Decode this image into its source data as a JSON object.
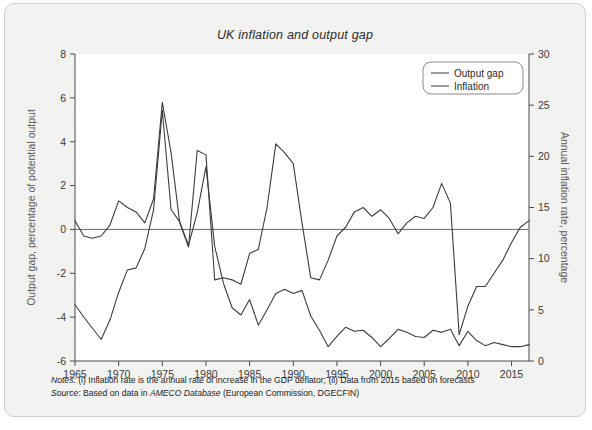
{
  "figure": {
    "title": "UK inflation and output gap",
    "background_color": "#f2f2f0",
    "plot_background_color": "#ffffff",
    "border_color": "#cfcfcb",
    "line_color": "#3c3c3c"
  },
  "notes": {
    "notes_label": "Notes:",
    "notes_text": " (i) Inflation rate is the annual rate of increase in the GDP deflator; (ii) Data from 2015 based on forecasts",
    "source_label": "Source:",
    "source_text_pre": " Based on data in ",
    "source_italic": "AMECO Database",
    "source_text_post": " (European Commission, DGECFIN)"
  },
  "chart_data": {
    "type": "line",
    "title": "UK inflation and output gap",
    "xlabel": "",
    "ylabel": "Output gap, percentage of potential output",
    "y2label": "Annual inflation rate, percentage",
    "xlim": [
      1965,
      2017
    ],
    "ylim": [
      -6,
      8
    ],
    "y2lim": [
      0,
      30
    ],
    "xticks": [
      1965,
      1970,
      1975,
      1980,
      1985,
      1990,
      1995,
      2000,
      2005,
      2010,
      2015
    ],
    "yticks": [
      -6,
      -4,
      -2,
      0,
      2,
      4,
      6,
      8
    ],
    "y2ticks": [
      0,
      5,
      10,
      15,
      20,
      25,
      30
    ],
    "grid": false,
    "legend_position": "top-right",
    "zero_line": true,
    "x": [
      1965,
      1966,
      1967,
      1968,
      1969,
      1970,
      1971,
      1972,
      1973,
      1974,
      1975,
      1976,
      1977,
      1978,
      1979,
      1980,
      1981,
      1982,
      1983,
      1984,
      1985,
      1986,
      1987,
      1988,
      1989,
      1990,
      1991,
      1992,
      1993,
      1994,
      1995,
      1996,
      1997,
      1998,
      1999,
      2000,
      2001,
      2002,
      2003,
      2004,
      2005,
      2006,
      2007,
      2008,
      2009,
      2010,
      2011,
      2012,
      2013,
      2014,
      2015,
      2016,
      2017
    ],
    "series": [
      {
        "name": "Output gap",
        "axis": "left",
        "unit": "percentage of potential output",
        "values": [
          0.4,
          -0.3,
          -0.4,
          -0.3,
          0.2,
          1.3,
          1.0,
          0.8,
          0.3,
          1.4,
          5.8,
          3.5,
          0.3,
          -0.8,
          3.6,
          3.4,
          -2.3,
          -2.2,
          -2.3,
          -2.5,
          -1.1,
          -0.9,
          1.0,
          3.9,
          3.5,
          3.0,
          0.3,
          -2.2,
          -2.3,
          -1.4,
          -0.3,
          0.1,
          0.8,
          1.0,
          0.6,
          0.9,
          0.5,
          -0.2,
          0.3,
          0.6,
          0.5,
          1.0,
          2.1,
          1.2,
          -4.8,
          -3.5,
          -2.6,
          -2.6,
          -2.0,
          -1.4,
          -0.6,
          0.1,
          0.4
        ]
      },
      {
        "name": "Inflation",
        "axis": "right",
        "unit": "annual percentage",
        "values": [
          5.5,
          4.3,
          3.2,
          2.1,
          4.0,
          6.7,
          8.9,
          9.1,
          11.0,
          14.8,
          24.5,
          14.8,
          13.6,
          11.3,
          14.5,
          19.0,
          11.2,
          7.6,
          5.2,
          4.5,
          6.0,
          3.5,
          5.0,
          6.6,
          7.0,
          6.6,
          6.9,
          4.4,
          3.0,
          1.4,
          2.4,
          3.3,
          2.9,
          3.0,
          2.3,
          1.4,
          2.2,
          3.1,
          2.8,
          2.4,
          2.3,
          3.0,
          2.8,
          3.1,
          1.5,
          2.9,
          2.0,
          1.5,
          1.8,
          1.6,
          1.4,
          1.4,
          1.6
        ]
      }
    ],
    "legend": [
      "Output gap",
      "Inflation"
    ]
  },
  "axes": {
    "left_title": "Output gap, percentage of potential output",
    "right_title": "Annual inflation rate, percentage"
  }
}
